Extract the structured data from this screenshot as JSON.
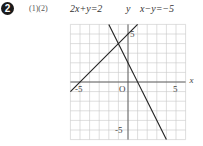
{
  "problem": {
    "number_badge": "2",
    "parts_label": "(1)(2)"
  },
  "equations": [
    {
      "label": "2x+y=2",
      "slope": -2,
      "intercept": 2
    },
    {
      "label": "x−y=−5",
      "slope": 1,
      "intercept": 5
    }
  ],
  "axes": {
    "x_label": "x",
    "y_label": "y",
    "origin_label": "O",
    "x_ticks": [
      "-5",
      "5"
    ],
    "y_ticks": [
      "5",
      "-5"
    ],
    "x_range": [
      -6,
      6
    ],
    "y_range": [
      -6,
      6
    ]
  },
  "intersection": [
    -1,
    4
  ]
}
